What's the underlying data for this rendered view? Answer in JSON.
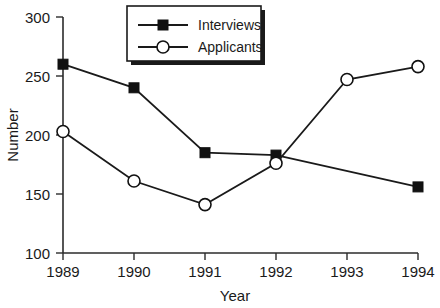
{
  "chart_data": {
    "type": "line",
    "title": "",
    "xlabel": "Year",
    "ylabel": "Number",
    "categories": [
      "1989",
      "1990",
      "1991",
      "1992",
      "1993",
      "1994"
    ],
    "x": [
      1989,
      1990,
      1991,
      1992,
      1993,
      1994
    ],
    "series": [
      {
        "name": "Interviews",
        "marker": "filled-square",
        "values": [
          260,
          240,
          185,
          183,
          null,
          156
        ]
      },
      {
        "name": "Applicants",
        "marker": "open-circle",
        "values": [
          203,
          161,
          141,
          176,
          247,
          258
        ]
      }
    ],
    "ylim": [
      100,
      300
    ],
    "yticks": [
      100,
      150,
      200,
      250,
      300
    ],
    "ytick_labels": [
      "100",
      "150",
      "200",
      "250",
      "300"
    ],
    "grid": false,
    "legend_position": "top-center",
    "legend_entries": [
      "Interviews",
      "Applicants"
    ],
    "colors": {
      "axis": "#2b2b2b",
      "line": "#1a1a1a",
      "interviews_marker": "#111111",
      "applicants_marker": "#ffffff",
      "background": "#ffffff"
    }
  },
  "axes": {
    "y_title": "Number",
    "x_title": "Year"
  },
  "legend": {
    "items": [
      {
        "label": "Interviews"
      },
      {
        "label": "Applicants"
      }
    ]
  }
}
